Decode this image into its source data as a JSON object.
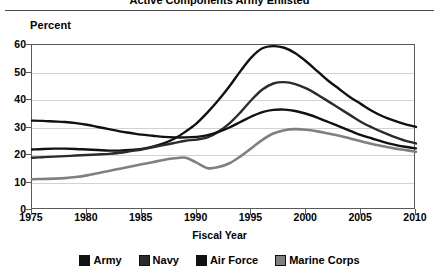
{
  "header": {
    "title": "Active Components Army Enlisted",
    "rule": "horizontal-rule"
  },
  "axes": {
    "ylabel": "Percent",
    "xlabel": "Fiscal Year",
    "yticks": [
      "0",
      "10",
      "20",
      "30",
      "40",
      "50",
      "60"
    ],
    "xticks": [
      "1975",
      "1980",
      "1985",
      "1990",
      "1995",
      "2000",
      "2005",
      "2010"
    ]
  },
  "legend": {
    "items": [
      {
        "label": "Army",
        "color": "#111111",
        "swatch": "legend-swatch-army"
      },
      {
        "label": "Navy",
        "color": "#2b2b2b",
        "swatch": "legend-swatch-navy"
      },
      {
        "label": "Air Force",
        "color": "#111111",
        "swatch": "legend-swatch-air-force"
      },
      {
        "label": "Marine Corps",
        "color": "#808080",
        "swatch": "legend-swatch-marine-corps"
      }
    ]
  },
  "chart_data": {
    "type": "line",
    "title": "Active Components Army Enlisted",
    "xlabel": "Fiscal Year",
    "ylabel": "Percent",
    "xlim": [
      1975,
      2010
    ],
    "ylim": [
      0,
      60
    ],
    "xticks": [
      1975,
      1980,
      1985,
      1990,
      1995,
      2000,
      2005,
      2010
    ],
    "yticks": [
      0,
      10,
      20,
      30,
      40,
      50,
      60
    ],
    "grid": "horizontal",
    "legend_position": "bottom",
    "x": [
      1975,
      1976,
      1977,
      1978,
      1979,
      1980,
      1981,
      1982,
      1983,
      1984,
      1985,
      1986,
      1987,
      1988,
      1989,
      1990,
      1991,
      1992,
      1993,
      1994,
      1995,
      1996,
      1997,
      1998,
      1999,
      2000,
      2001,
      2002,
      2003,
      2004,
      2005,
      2006,
      2007,
      2008,
      2009,
      2010
    ],
    "series": [
      {
        "name": "Army",
        "color": "#111111",
        "values": [
          22.0,
          22.2,
          22.3,
          22.3,
          22.2,
          22.0,
          21.8,
          21.6,
          21.6,
          21.8,
          22.2,
          23.0,
          24.2,
          26.0,
          28.5,
          31.5,
          35.5,
          40.0,
          45.0,
          50.5,
          55.5,
          58.8,
          59.6,
          59.0,
          57.0,
          54.0,
          50.5,
          47.0,
          44.0,
          41.0,
          38.5,
          36.0,
          34.0,
          32.5,
          31.2,
          30.2
        ]
      },
      {
        "name": "Navy",
        "color": "#2b2b2b",
        "values": [
          19.0,
          19.2,
          19.4,
          19.6,
          19.8,
          20.0,
          20.2,
          20.4,
          20.8,
          21.4,
          22.0,
          22.8,
          23.6,
          24.4,
          25.2,
          25.6,
          26.4,
          28.5,
          31.5,
          35.5,
          40.0,
          43.8,
          46.0,
          46.5,
          45.8,
          44.2,
          42.0,
          39.5,
          37.0,
          34.5,
          32.0,
          30.0,
          28.2,
          26.6,
          25.2,
          24.2
        ]
      },
      {
        "name": "Air Force",
        "color": "#111111",
        "values": [
          32.5,
          32.4,
          32.2,
          32.0,
          31.6,
          31.0,
          30.2,
          29.4,
          28.6,
          28.0,
          27.4,
          27.0,
          26.6,
          26.4,
          26.4,
          26.6,
          27.2,
          28.4,
          30.0,
          32.0,
          34.0,
          35.6,
          36.4,
          36.5,
          36.0,
          35.0,
          33.6,
          32.0,
          30.4,
          28.8,
          27.2,
          26.0,
          24.8,
          23.8,
          23.0,
          22.4
        ]
      },
      {
        "name": "Marine Corps",
        "color": "#808080",
        "values": [
          11.2,
          11.3,
          11.4,
          11.6,
          12.0,
          12.6,
          13.4,
          14.2,
          15.0,
          15.8,
          16.6,
          17.4,
          18.2,
          18.8,
          19.0,
          17.2,
          15.2,
          15.6,
          17.0,
          19.5,
          22.5,
          25.5,
          27.8,
          29.0,
          29.4,
          29.2,
          28.6,
          27.8,
          27.0,
          26.0,
          25.0,
          24.0,
          23.2,
          22.4,
          21.8,
          21.2
        ]
      }
    ]
  }
}
